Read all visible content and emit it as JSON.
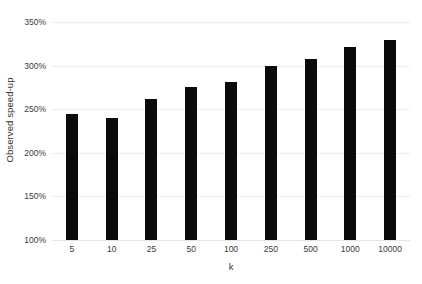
{
  "chart_data": {
    "type": "bar",
    "title": "",
    "subtitle": "",
    "xlabel": "k",
    "ylabel": "Observed speed-up",
    "categories": [
      "5",
      "10",
      "25",
      "50",
      "100",
      "250",
      "500",
      "1000",
      "10000"
    ],
    "values": [
      245,
      240,
      262,
      275,
      281,
      300,
      308,
      321,
      329
    ],
    "value_labels": [
      "245%",
      "240%",
      "262%",
      "275%",
      "281%",
      "300%",
      "308%",
      "321%",
      "329%"
    ],
    "ylim": [
      100,
      350
    ],
    "ytick_labels": [
      "100%",
      "150%",
      "200%",
      "250%",
      "300%",
      "350%"
    ],
    "ytick_values": [
      100,
      150,
      200,
      250,
      300,
      350
    ],
    "grid": true,
    "legend": null,
    "legend_position": "none",
    "series": [
      {
        "name": "Observed speed-up",
        "values": [
          245,
          240,
          262,
          275,
          281,
          300,
          308,
          321,
          329
        ]
      }
    ],
    "colors": {
      "bar": "#0a0a0a",
      "gridline": "#eceded",
      "background": "#ffffff",
      "text": "#3a3a3a"
    }
  }
}
